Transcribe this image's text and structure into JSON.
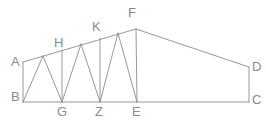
{
  "figure": {
    "type": "geometry-diagram",
    "stroke_color": "#8c8c8c",
    "label_color": "#8a8a8a",
    "background_color": "#ffffff",
    "canvas": {
      "width": 266,
      "height": 125
    }
  },
  "labels": [
    {
      "id": "A",
      "text": "A",
      "x": 11,
      "y": 55
    },
    {
      "id": "B",
      "text": "B",
      "x": 11,
      "y": 90
    },
    {
      "id": "H",
      "text": "H",
      "x": 54,
      "y": 36
    },
    {
      "id": "K",
      "text": "K",
      "x": 92,
      "y": 20
    },
    {
      "id": "F",
      "text": "F",
      "x": 128,
      "y": 6
    },
    {
      "id": "D",
      "text": "D",
      "x": 252,
      "y": 60
    },
    {
      "id": "C",
      "text": "C",
      "x": 252,
      "y": 93
    },
    {
      "id": "G",
      "text": "G",
      "x": 57,
      "y": 105
    },
    {
      "id": "Z",
      "text": "Z",
      "x": 95,
      "y": 105
    },
    {
      "id": "E",
      "text": "E",
      "x": 132,
      "y": 105
    }
  ],
  "vertices": {
    "A": {
      "x": 23,
      "y": 62
    },
    "B": {
      "x": 23,
      "y": 102
    },
    "G": {
      "x": 62,
      "y": 102
    },
    "Z": {
      "x": 100,
      "y": 102
    },
    "E": {
      "x": 137,
      "y": 102
    },
    "C": {
      "x": 249,
      "y": 102
    },
    "D": {
      "x": 249,
      "y": 67
    },
    "F": {
      "x": 136,
      "y": 29
    },
    "T1": {
      "x": 43,
      "y": 56
    },
    "H": {
      "x": 62,
      "y": 50
    },
    "T2": {
      "x": 81,
      "y": 44
    },
    "K": {
      "x": 100,
      "y": 38
    },
    "T3": {
      "x": 118,
      "y": 33
    }
  },
  "edges": [
    {
      "name": "left-post-AB",
      "from": "A",
      "to": "B"
    },
    {
      "name": "bottom-chord-BC",
      "from": "B",
      "to": "C"
    },
    {
      "name": "right-post-DC",
      "from": "D",
      "to": "C"
    },
    {
      "name": "top-chord-AF",
      "from": "A",
      "to": "F"
    },
    {
      "name": "top-chord-FD",
      "from": "F",
      "to": "D"
    },
    {
      "name": "web-B-T1",
      "from": "B",
      "to": "T1"
    },
    {
      "name": "web-T1-G",
      "from": "T1",
      "to": "G"
    },
    {
      "name": "web-G-T2",
      "from": "G",
      "to": "T2"
    },
    {
      "name": "web-T2-Z",
      "from": "T2",
      "to": "Z"
    },
    {
      "name": "web-Z-T3",
      "from": "Z",
      "to": "T3"
    },
    {
      "name": "web-T3-E",
      "from": "T3",
      "to": "E"
    },
    {
      "name": "post-H-G",
      "from": "H",
      "to": "G"
    },
    {
      "name": "post-K-Z",
      "from": "K",
      "to": "Z"
    },
    {
      "name": "post-F-E",
      "from": "F",
      "to": "E"
    }
  ]
}
